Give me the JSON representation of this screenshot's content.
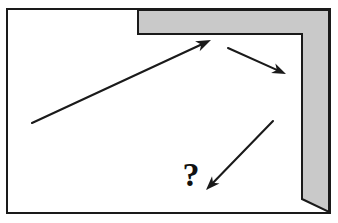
{
  "figure": {
    "type": "line-diagram",
    "caption": "",
    "background_color": "#ffffff",
    "stroke_color": "#1a1a1a",
    "shaded_color": "#c9c9c9"
  },
  "frame": {
    "label": "outer-rectangle",
    "x": 7,
    "y": 9,
    "width": 323,
    "height": 204,
    "stroke_width": 2,
    "stroke_color": "#1a1a1a",
    "fill": "#ffffff"
  },
  "shaded_region": {
    "label": "L-shaped-shaded-area",
    "fill": "#c9c9c9",
    "stroke_color": "#1a1a1a",
    "stroke_width": 2,
    "points": "138,10 329,10 329,212 302,199 302,34 138,34",
    "horizontal_band": {
      "x": 138,
      "y": 10,
      "width": 191,
      "height": 24
    },
    "vertical_band": {
      "x": 302,
      "y": 10,
      "width": 27,
      "height": 189
    }
  },
  "arrows": [
    {
      "id": "arrow-long-up-right",
      "label": "long diagonal arrow pointing up-right",
      "tail_x": 32,
      "tail_y": 123,
      "head_x": 211,
      "head_y": 40,
      "direction": "up-right",
      "stroke_width": 2.1,
      "head_length": 15,
      "head_width": 5.5
    },
    {
      "id": "arrow-short-down-right",
      "label": "short arrow pointing down-right",
      "tail_x": 228,
      "tail_y": 48,
      "head_x": 286,
      "head_y": 74,
      "direction": "down-right",
      "stroke_width": 2.1,
      "head_length": 14,
      "head_width": 5.2
    },
    {
      "id": "arrow-down-left-to-question",
      "label": "arrow pointing down-left toward the question mark",
      "tail_x": 273,
      "tail_y": 121,
      "head_x": 206,
      "head_y": 190,
      "direction": "down-left",
      "stroke_width": 2.1,
      "head_length": 14,
      "head_width": 5.2
    }
  ],
  "labels": [
    {
      "id": "question-mark",
      "text": "?",
      "x": 191,
      "y": 186,
      "font_size": 34,
      "font_weight": "bold",
      "color": "#111111"
    }
  ]
}
